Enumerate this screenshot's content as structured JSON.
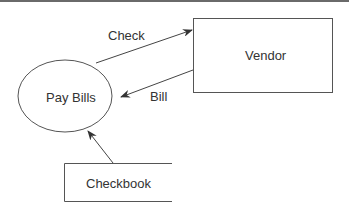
{
  "diagram": {
    "type": "data-flow",
    "nodes": [
      {
        "id": "pay-bills",
        "label": "Pay Bills",
        "shape": "ellipse"
      },
      {
        "id": "vendor",
        "label": "Vendor",
        "shape": "rectangle"
      },
      {
        "id": "checkbook",
        "label": "Checkbook",
        "shape": "data-store"
      }
    ],
    "edges": [
      {
        "from": "pay-bills",
        "to": "vendor",
        "label": "Check"
      },
      {
        "from": "vendor",
        "to": "pay-bills",
        "label": "Bill"
      },
      {
        "from": "checkbook",
        "to": "pay-bills",
        "label": ""
      }
    ]
  },
  "labels": {
    "pay_bills": "Pay Bills",
    "vendor": "Vendor",
    "checkbook": "Checkbook",
    "check": "Check",
    "bill": "Bill"
  },
  "colors": {
    "stroke": "#555555",
    "text": "#333333",
    "background": "#ffffff"
  }
}
